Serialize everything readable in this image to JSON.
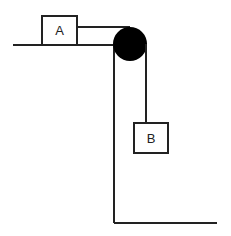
{
  "diagram": {
    "type": "pulley-system",
    "blocks": [
      {
        "label": "A",
        "position": "on horizontal surface"
      },
      {
        "label": "B",
        "position": "hanging from pulley"
      }
    ],
    "colors": {
      "line": "#222222",
      "pulley": "#000000",
      "background": "#ffffff"
    }
  }
}
